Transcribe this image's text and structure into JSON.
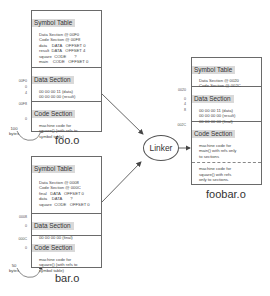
{
  "foo": {
    "label": "foo.o",
    "symbol_table": {
      "title": "Symbol Table",
      "lines": [
        "Data Section @ 00F0",
        "Code Section @ 00F8",
        "data    DATA   OFFSET 0",
        "result  DATA   OFFSET 4",
        "square  CODE       ?",
        "main    CODE   OFFSET 0"
      ]
    },
    "data_section": {
      "title": "Data Section",
      "lines": [
        "00 00 00 11 (data)",
        "00 00 00 00 (result)"
      ]
    },
    "code_section": {
      "title": "Code Section",
      "lines": [
        "machine code for",
        "square() (with refs to",
        "symbol table)"
      ]
    },
    "addresses": {
      "data_start": "00F0",
      "data_0": "0",
      "data_4": "4",
      "code_start": "00F8",
      "code_0": "0"
    },
    "size": {
      "value": "100",
      "unit": "bytes"
    }
  },
  "bar": {
    "label": "bar.o",
    "symbol_table": {
      "title": "Symbol Table",
      "lines": [
        "Data Section @ 0008",
        "Code Section @ 000C",
        "final   DATA   OFFSET 0",
        "data    DATA       ?",
        "square  CODE   OFFSET 0"
      ]
    },
    "data_section": {
      "title": "Data Section",
      "lines": [
        "00 00 00 00 (final)"
      ]
    },
    "code_section": {
      "title": "Code Section",
      "lines": [
        "machine code for",
        "square() (with refs to",
        "symbol table)"
      ]
    },
    "addresses": {
      "data_start": "0008",
      "data_0": "0",
      "code_start": "000C",
      "code_0": "0"
    },
    "size": {
      "value": "50",
      "unit": "bytes"
    }
  },
  "linker": {
    "label": "Linker"
  },
  "foobar": {
    "label": "foobar.o",
    "symbol_table": {
      "title": "Symbol Table",
      "lines": [
        "Data Section @ 0020",
        "Code Section @ 002C"
      ]
    },
    "data_section": {
      "title": "Data Section",
      "lines": [
        "00 00 00 11 (data)",
        "00 00 00 00 (result)",
        "00 00 00 00 (final)"
      ]
    },
    "code_section": {
      "title": "Code Section",
      "main_lines": [
        "machine code for",
        "main() with refs only",
        "to sections"
      ],
      "square_lines": [
        "machine code for",
        "square() with refs",
        "only to sections."
      ]
    },
    "addresses": {
      "data_start": "0020",
      "data_0": "0",
      "data_4": "4",
      "data_8": "8",
      "code_start": "002C"
    }
  }
}
